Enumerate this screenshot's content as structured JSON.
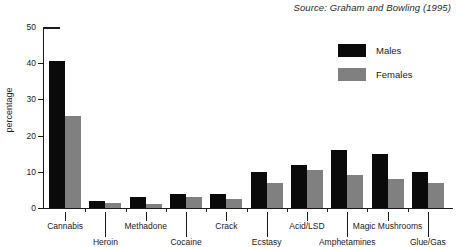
{
  "source_note": "Source: Graham and Bowling (1995)",
  "legend": {
    "position": "top-right",
    "entries": [
      {
        "label": "Males",
        "color": "#0a0a0a",
        "swatch": "males-swatch"
      },
      {
        "label": "Females",
        "color": "#808080",
        "swatch": "females-swatch"
      }
    ]
  },
  "axes": {
    "ylabel": "percentage",
    "yticks": [
      "0",
      "10",
      "20",
      "30",
      "40",
      "50"
    ]
  },
  "chart_data": {
    "type": "bar",
    "title": "",
    "subtitle": "",
    "xlabel": "",
    "ylabel": "percentage",
    "ylim": [
      0,
      50
    ],
    "ytick_values": [
      0,
      10,
      20,
      30,
      40,
      50
    ],
    "grid": false,
    "legend_position": "top-right",
    "annotations": [
      "Source: Graham and Bowling (1995)"
    ],
    "categories": [
      "Cannabis",
      "Heroin",
      "Methadone",
      "Cocaine",
      "Crack",
      "Ecstasy",
      "Acid/LSD",
      "Amphetamines",
      "Magic Mushrooms",
      "Glue/Gas"
    ],
    "series": [
      {
        "name": "Males",
        "color": "#0a0a0a",
        "values": [
          40.5,
          2,
          3,
          4,
          4,
          10,
          12,
          16,
          15,
          10
        ]
      },
      {
        "name": "Females",
        "color": "#808080",
        "values": [
          25.5,
          1.5,
          1,
          3,
          2.5,
          7,
          10.5,
          9,
          8,
          7
        ]
      }
    ]
  }
}
